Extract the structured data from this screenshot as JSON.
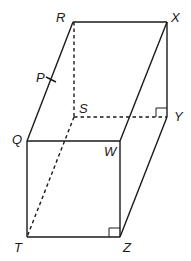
{
  "figure": {
    "type": "rectangular prism (oblique view)",
    "vertices": {
      "R": {
        "label": "R",
        "x": 73,
        "y": 22
      },
      "X": {
        "label": "X",
        "x": 167,
        "y": 22
      },
      "Y": {
        "label": "Y",
        "x": 167,
        "y": 117
      },
      "S": {
        "label": "S",
        "x": 74,
        "y": 117
      },
      "Q": {
        "label": "Q",
        "x": 27,
        "y": 141
      },
      "W": {
        "label": "W",
        "x": 120,
        "y": 141
      },
      "T": {
        "label": "T",
        "x": 27,
        "y": 237
      },
      "Z": {
        "label": "Z",
        "x": 120,
        "y": 237
      },
      "P": {
        "label": "P",
        "x": 51,
        "y": 80
      }
    },
    "solid_edges": [
      "RX",
      "XY",
      "RQ",
      "XW",
      "QW",
      "QT",
      "WZ",
      "TZ",
      "YZ"
    ],
    "hidden_edges": [
      "RS",
      "SY",
      "ST"
    ],
    "right_angle_marks": [
      "Y",
      "Z"
    ],
    "tick_marks": [
      "P on RQ"
    ]
  }
}
